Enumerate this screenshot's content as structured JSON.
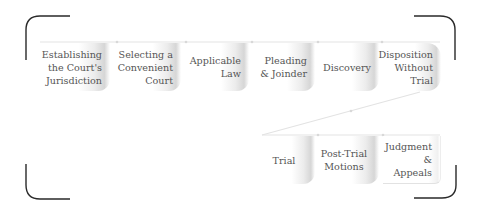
{
  "diagram": {
    "title": "",
    "row1": [
      {
        "id": "s1",
        "label": "Establishing\nthe Court's\nJurisdiction"
      },
      {
        "id": "s2",
        "label": "Selecting a\nConvenient\nCourt"
      },
      {
        "id": "s3",
        "label": "Applicable\nLaw"
      },
      {
        "id": "s4",
        "label": "Pleading\n& Joinder"
      },
      {
        "id": "s5",
        "label": "Discovery"
      },
      {
        "id": "s6",
        "label": "Disposition\nWithout Trial"
      }
    ],
    "row2": [
      {
        "id": "s7",
        "label": "Trial"
      },
      {
        "id": "s8",
        "label": "Post-Trial\nMotions"
      },
      {
        "id": "s9",
        "label": "Judgment\n& Appeals"
      }
    ],
    "flow": "Establishing the Court's Jurisdiction → Selecting a Convenient Court → Applicable Law → Pleading & Joinder → Discovery → Disposition Without Trial → Trial → Post-Trial Motions → Judgment & Appeals",
    "colors": {
      "bracket": "#2a2a2a",
      "connector": "#dcdcdc",
      "box_shade": "#d6d6d6",
      "text": "#555555"
    }
  }
}
